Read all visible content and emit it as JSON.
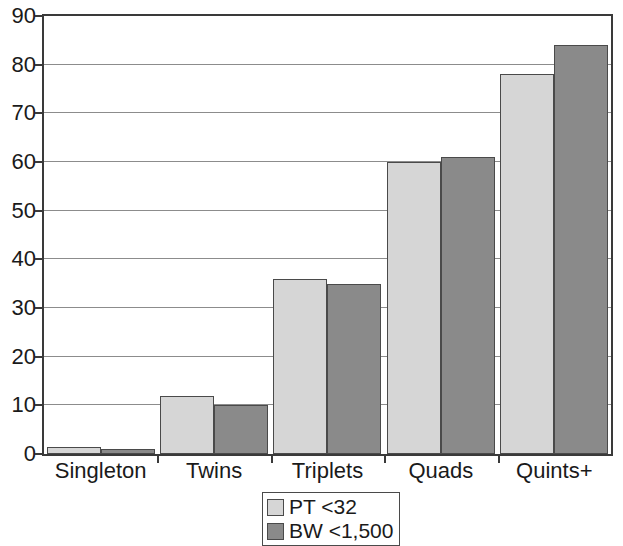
{
  "chart_data": {
    "type": "bar",
    "title": "",
    "subtitle": "",
    "xlabel": "",
    "ylabel": "",
    "categories": [
      "Singleton",
      "Twins",
      "Triplets",
      "Quads",
      "Quints+"
    ],
    "series": [
      {
        "name": "PT <32",
        "color": "#d6d6d6",
        "values": [
          1.5,
          12,
          36,
          60,
          78
        ]
      },
      {
        "name": "BW <1,500",
        "color": "#8a8a8a",
        "values": [
          1,
          10,
          35,
          61,
          84
        ]
      }
    ],
    "ylim": [
      0,
      90
    ],
    "y_ticks": [
      0,
      10,
      20,
      30,
      40,
      50,
      60,
      70,
      80,
      90
    ],
    "y_tick_labels": [
      "0",
      "10",
      "20",
      "30",
      "40",
      "50",
      "60",
      "70",
      "80",
      "90"
    ],
    "grid": true,
    "grid_axis": "y",
    "legend": {
      "position": "bottom-center",
      "entries": [
        {
          "label": "PT <32",
          "color": "#d6d6d6"
        },
        {
          "label": "BW <1,500",
          "color": "#8a8a8a"
        }
      ]
    }
  }
}
